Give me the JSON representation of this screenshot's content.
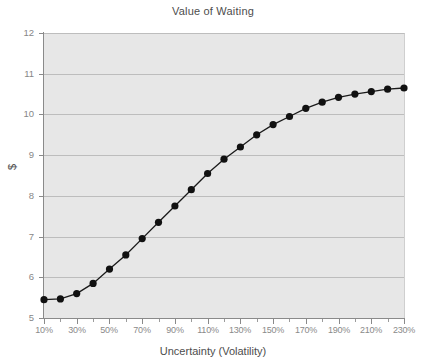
{
  "chart_data": {
    "type": "line",
    "title": "Value of Waiting",
    "xlabel": "Uncertainty (Volatility)",
    "ylabel": "$",
    "ylim": [
      5,
      12
    ],
    "xlim": [
      10,
      230
    ],
    "grid": true,
    "legend": false,
    "marker": "filled-circle",
    "y_ticks": [
      5,
      6,
      7,
      8,
      9,
      10,
      11,
      12
    ],
    "y_tick_labels": [
      "5",
      "6",
      "7",
      "8",
      "9",
      "10",
      "11",
      "12"
    ],
    "x_ticks": [
      10,
      30,
      50,
      70,
      90,
      110,
      130,
      150,
      170,
      190,
      210,
      230
    ],
    "x_tick_labels": [
      "10%",
      "30%",
      "50%",
      "70%",
      "90%",
      "110%",
      "130%",
      "150%",
      "170%",
      "190%",
      "210%",
      "230%"
    ],
    "x_minor_ticks": [
      20,
      40,
      60,
      80,
      100,
      120,
      140,
      160,
      180,
      200,
      220
    ],
    "x": [
      10,
      20,
      30,
      40,
      50,
      60,
      70,
      80,
      90,
      100,
      110,
      120,
      130,
      140,
      150,
      160,
      170,
      180,
      190,
      200,
      210,
      220,
      230
    ],
    "x_labels": [
      "10%",
      "20%",
      "30%",
      "40%",
      "50%",
      "60%",
      "70%",
      "80%",
      "90%",
      "100%",
      "110%",
      "120%",
      "130%",
      "140%",
      "150%",
      "160%",
      "170%",
      "180%",
      "190%",
      "200%",
      "210%",
      "220%",
      "230%"
    ],
    "values": [
      5.45,
      5.47,
      5.6,
      5.85,
      6.2,
      6.55,
      6.95,
      7.35,
      7.75,
      8.15,
      8.55,
      8.9,
      9.2,
      9.5,
      9.75,
      9.95,
      10.15,
      10.3,
      10.42,
      10.5,
      10.56,
      10.62,
      10.65
    ],
    "series": [
      {
        "name": "Value of Waiting",
        "color": "#111111",
        "values": [
          5.45,
          5.47,
          5.6,
          5.85,
          6.2,
          6.55,
          6.95,
          7.35,
          7.75,
          8.15,
          8.55,
          8.9,
          9.2,
          9.5,
          9.75,
          9.95,
          10.15,
          10.3,
          10.42,
          10.5,
          10.56,
          10.62,
          10.65
        ]
      }
    ],
    "colors": {
      "plot_background": "#e7e7e7",
      "page_background": "#ffffff",
      "gridline": "#bdbdbd",
      "axis": "#8a8a8a",
      "tick_text": "#8a8a8a",
      "title_text": "#4d4d4d",
      "series": "#111111"
    }
  }
}
